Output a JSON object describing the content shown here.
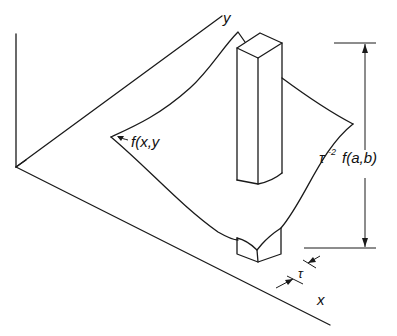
{
  "diagram": {
    "type": "3D surface with pillar (sampled function illustration)",
    "labels": {
      "y_axis": "y",
      "x_axis": "x",
      "surface": "f(x,y",
      "height_tau": "τ",
      "height_exp": "-2",
      "height_fn": "f(a,b)",
      "width": "τ"
    },
    "colors": {
      "line": "#1a1a1a",
      "background": "#ffffff"
    }
  }
}
